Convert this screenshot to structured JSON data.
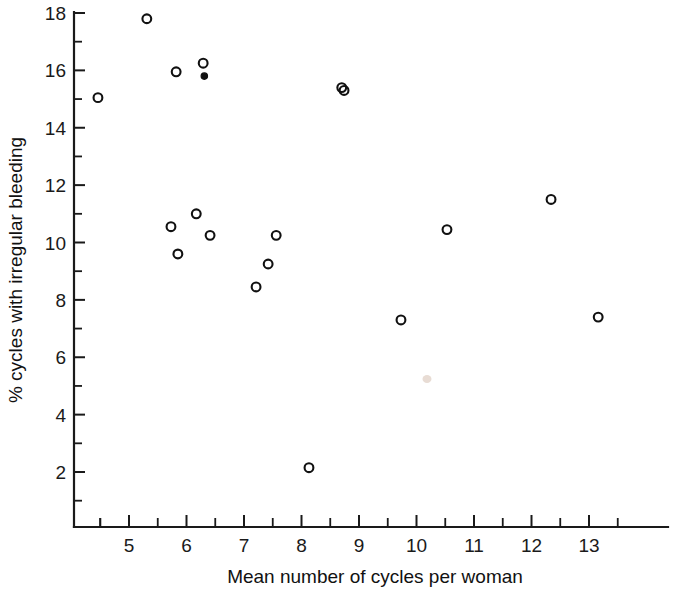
{
  "chart_data": {
    "type": "scatter",
    "title": "",
    "xlabel": "Mean number of cycles per woman",
    "ylabel": "% cycles with irregular bleeding",
    "xlim": [
      4.0,
      13.9
    ],
    "ylim": [
      0.6,
      18.4
    ],
    "xticks": [
      5,
      6,
      7,
      8,
      9,
      10,
      11,
      12,
      13
    ],
    "xticklabels": [
      "5",
      "6",
      "7",
      "8",
      "9",
      "10",
      "11",
      "12",
      "13"
    ],
    "x_minor_tick_step": 0.5,
    "yticks": [
      2,
      4,
      6,
      8,
      10,
      12,
      14,
      16,
      18
    ],
    "yticklabels": [
      "2",
      "4",
      "6",
      "8",
      "10",
      "12",
      "14",
      "16",
      "18"
    ],
    "y_minor_tick_step": 1,
    "grid": false,
    "legend": null,
    "marker_style": "open-circle",
    "points": [
      {
        "x": 4.46,
        "y": 15.05,
        "style": "open"
      },
      {
        "x": 5.31,
        "y": 17.8,
        "style": "open"
      },
      {
        "x": 5.82,
        "y": 15.95,
        "style": "open"
      },
      {
        "x": 6.29,
        "y": 16.25,
        "style": "open"
      },
      {
        "x": 6.31,
        "y": 15.8,
        "style": "filled"
      },
      {
        "x": 8.7,
        "y": 15.4,
        "style": "open"
      },
      {
        "x": 8.74,
        "y": 15.3,
        "style": "open"
      },
      {
        "x": 12.34,
        "y": 11.5,
        "style": "open"
      },
      {
        "x": 6.17,
        "y": 11.0,
        "style": "open"
      },
      {
        "x": 5.73,
        "y": 10.55,
        "style": "open"
      },
      {
        "x": 10.53,
        "y": 10.45,
        "style": "open"
      },
      {
        "x": 6.41,
        "y": 10.25,
        "style": "open"
      },
      {
        "x": 7.56,
        "y": 10.25,
        "style": "open"
      },
      {
        "x": 5.85,
        "y": 9.6,
        "style": "open"
      },
      {
        "x": 7.42,
        "y": 9.25,
        "style": "open"
      },
      {
        "x": 7.21,
        "y": 8.45,
        "style": "open"
      },
      {
        "x": 13.16,
        "y": 7.4,
        "style": "open"
      },
      {
        "x": 9.73,
        "y": 7.3,
        "style": "open"
      },
      {
        "x": 8.13,
        "y": 2.15,
        "style": "open"
      }
    ]
  },
  "axes": {
    "x_title": "Mean number of cycles per woman",
    "y_title": "% cycles with irregular bleeding"
  }
}
